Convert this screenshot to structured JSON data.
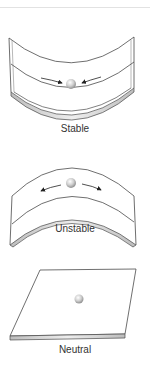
{
  "figure": {
    "panels": [
      {
        "id": "stable",
        "label": "Stable",
        "arrows": "inward"
      },
      {
        "id": "unstable",
        "label": "Unstable",
        "arrows": "outward"
      },
      {
        "id": "neutral",
        "label": "Neutral",
        "arrows": "none"
      }
    ]
  },
  "colors": {
    "outline": "#4a4a4a",
    "surface": "#ffffff",
    "edge_fill": "#d9d9d9",
    "ball": "#c8c8c8",
    "text": "#333333"
  }
}
